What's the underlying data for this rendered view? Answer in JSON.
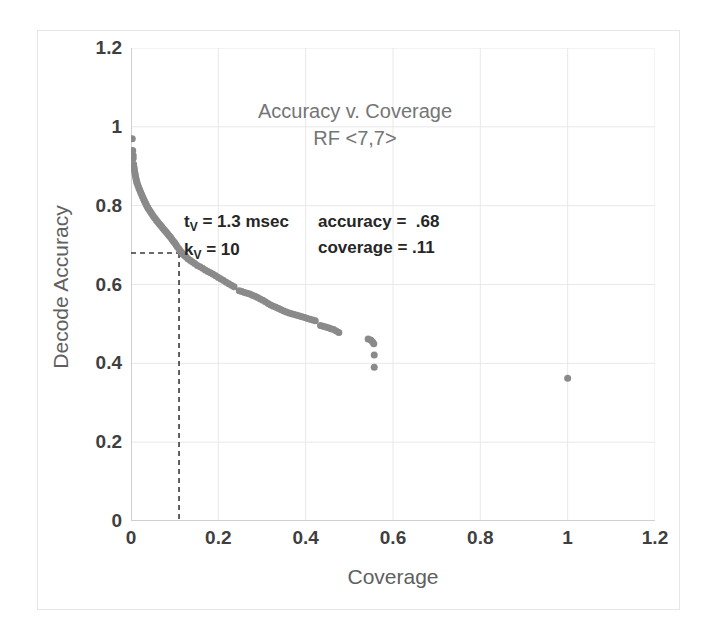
{
  "chart_data": {
    "type": "scatter",
    "title": "Accuracy v. Coverage",
    "subtitle": "RF <7,7>",
    "xlabel": "Coverage",
    "ylabel": "Decode Accuracy",
    "xlim": [
      0,
      1.2
    ],
    "ylim": [
      0,
      1.2
    ],
    "xticks": [
      "0",
      "0.2",
      "0.4",
      "0.6",
      "0.8",
      "1",
      "1.2"
    ],
    "xtick_values": [
      0,
      0.2,
      0.4,
      0.6,
      0.8,
      1.0,
      1.2
    ],
    "yticks": [
      "0",
      "0.2",
      "0.4",
      "0.6",
      "0.8",
      "1",
      "1.2"
    ],
    "ytick_values": [
      0,
      0.2,
      0.4,
      0.6,
      0.8,
      1.0,
      1.2
    ],
    "grid": true,
    "legend": null,
    "marker_color": "#8a8a8a",
    "marker_size": 7,
    "series": [
      {
        "name": "Accuracy vs Coverage",
        "points": [
          [
            0.003,
            0.97
          ],
          [
            0.004,
            0.94
          ],
          [
            0.005,
            0.928
          ],
          [
            0.005,
            0.92
          ],
          [
            0.006,
            0.905
          ],
          [
            0.007,
            0.897
          ],
          [
            0.008,
            0.89
          ],
          [
            0.009,
            0.883
          ],
          [
            0.01,
            0.877
          ],
          [
            0.011,
            0.871
          ],
          [
            0.012,
            0.866
          ],
          [
            0.013,
            0.861
          ],
          [
            0.014,
            0.857
          ],
          [
            0.016,
            0.851
          ],
          [
            0.018,
            0.845
          ],
          [
            0.02,
            0.84
          ],
          [
            0.022,
            0.834
          ],
          [
            0.024,
            0.829
          ],
          [
            0.026,
            0.824
          ],
          [
            0.028,
            0.819
          ],
          [
            0.03,
            0.814
          ],
          [
            0.032,
            0.809
          ],
          [
            0.034,
            0.805
          ],
          [
            0.036,
            0.8
          ],
          [
            0.038,
            0.796
          ],
          [
            0.04,
            0.792
          ],
          [
            0.043,
            0.787
          ],
          [
            0.046,
            0.782
          ],
          [
            0.049,
            0.777
          ],
          [
            0.052,
            0.772
          ],
          [
            0.055,
            0.768
          ],
          [
            0.058,
            0.763
          ],
          [
            0.061,
            0.759
          ],
          [
            0.064,
            0.755
          ],
          [
            0.067,
            0.751
          ],
          [
            0.07,
            0.747
          ],
          [
            0.073,
            0.743
          ],
          [
            0.076,
            0.739
          ],
          [
            0.079,
            0.735
          ],
          [
            0.082,
            0.731
          ],
          [
            0.085,
            0.727
          ],
          [
            0.088,
            0.723
          ],
          [
            0.091,
            0.719
          ],
          [
            0.094,
            0.714
          ],
          [
            0.097,
            0.71
          ],
          [
            0.1,
            0.706
          ],
          [
            0.103,
            0.701
          ],
          [
            0.106,
            0.696
          ],
          [
            0.11,
            0.69
          ],
          [
            0.113,
            0.685
          ],
          [
            0.116,
            0.681
          ],
          [
            0.119,
            0.677
          ],
          [
            0.123,
            0.673
          ],
          [
            0.127,
            0.669
          ],
          [
            0.131,
            0.665
          ],
          [
            0.136,
            0.661
          ],
          [
            0.141,
            0.657
          ],
          [
            0.146,
            0.653
          ],
          [
            0.152,
            0.648
          ],
          [
            0.158,
            0.645
          ],
          [
            0.164,
            0.641
          ],
          [
            0.17,
            0.637
          ],
          [
            0.176,
            0.633
          ],
          [
            0.182,
            0.63
          ],
          [
            0.188,
            0.626
          ],
          [
            0.194,
            0.622
          ],
          [
            0.2,
            0.618
          ],
          [
            0.206,
            0.614
          ],
          [
            0.212,
            0.61
          ],
          [
            0.218,
            0.606
          ],
          [
            0.224,
            0.602
          ],
          [
            0.23,
            0.598
          ],
          [
            0.236,
            0.594
          ],
          [
            0.248,
            0.584
          ],
          [
            0.254,
            0.582
          ],
          [
            0.26,
            0.58
          ],
          [
            0.266,
            0.578
          ],
          [
            0.272,
            0.576
          ],
          [
            0.278,
            0.573
          ],
          [
            0.284,
            0.57
          ],
          [
            0.29,
            0.567
          ],
          [
            0.296,
            0.563
          ],
          [
            0.302,
            0.56
          ],
          [
            0.308,
            0.556
          ],
          [
            0.314,
            0.552
          ],
          [
            0.32,
            0.548
          ],
          [
            0.326,
            0.545
          ],
          [
            0.332,
            0.542
          ],
          [
            0.338,
            0.539
          ],
          [
            0.344,
            0.536
          ],
          [
            0.35,
            0.533
          ],
          [
            0.356,
            0.53
          ],
          [
            0.362,
            0.528
          ],
          [
            0.368,
            0.526
          ],
          [
            0.374,
            0.524
          ],
          [
            0.38,
            0.522
          ],
          [
            0.386,
            0.52
          ],
          [
            0.392,
            0.518
          ],
          [
            0.398,
            0.516
          ],
          [
            0.404,
            0.514
          ],
          [
            0.41,
            0.512
          ],
          [
            0.416,
            0.51
          ],
          [
            0.422,
            0.508
          ],
          [
            0.434,
            0.496
          ],
          [
            0.44,
            0.494
          ],
          [
            0.446,
            0.492
          ],
          [
            0.452,
            0.49
          ],
          [
            0.458,
            0.488
          ],
          [
            0.464,
            0.486
          ],
          [
            0.47,
            0.482
          ],
          [
            0.476,
            0.478
          ],
          [
            0.543,
            0.462
          ],
          [
            0.549,
            0.459
          ],
          [
            0.553,
            0.455
          ],
          [
            0.556,
            0.45
          ],
          [
            0.557,
            0.421
          ],
          [
            0.557,
            0.39
          ],
          [
            1.0,
            0.362
          ]
        ]
      }
    ],
    "annotations": [
      {
        "name": "guide-lines",
        "type": "dashed-crosshair",
        "x": 0.11,
        "y": 0.68,
        "color": "#3a3a3a"
      }
    ]
  },
  "chart": {
    "title": "Accuracy v. Coverage",
    "subtitle": "RF <7,7>",
    "x_axis_title": "Coverage",
    "y_axis_title": "Decode Accuracy",
    "x_tick_labels": [
      "0",
      "0.2",
      "0.4",
      "0.6",
      "0.8",
      "1",
      "1.2"
    ],
    "y_tick_labels": [
      "0",
      "0.2",
      "0.4",
      "0.6",
      "0.8",
      "1",
      "1.2"
    ]
  },
  "annotations": {
    "params": {
      "line1_prefix": "t",
      "line1_sub": "V",
      "line1_rest": " = 1.3 msec",
      "line2_prefix": "k",
      "line2_sub": "V",
      "line2_rest": " = 10"
    },
    "values": {
      "accuracy_label": "accuracy =",
      "accuracy_value": ".68",
      "coverage_label": "coverage =",
      "coverage_value": ".11"
    }
  },
  "colors": {
    "marker": "#8a8a8a",
    "gridline": "#e8e8e8",
    "axis_line": "#d0d0d0",
    "frame": "#e6e6e6",
    "tick_text": "#3f3f3f",
    "title_text": "#757575",
    "axis_title_text": "#606060",
    "annotation_text": "#262626",
    "guide_line": "#3a3a3a",
    "background": "#ffffff"
  }
}
